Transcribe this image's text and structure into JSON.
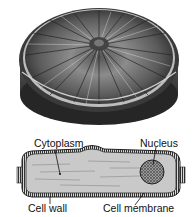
{
  "diagram": {
    "top_view": {
      "description": "disc-shaped cell, 3D view"
    },
    "cross_section": {
      "description": "cell cross section"
    },
    "labels": {
      "cytoplasm": "Cytoplasm",
      "nucleus": "Nucleus",
      "cell_wall": "Cell wall",
      "cell_membrane": "Cell membrane"
    },
    "colors": {
      "ink": "#111111",
      "dark_fill": "#3a3a3a",
      "mid_fill": "#8a8a8a",
      "light_fill": "#c8c8c8"
    }
  }
}
